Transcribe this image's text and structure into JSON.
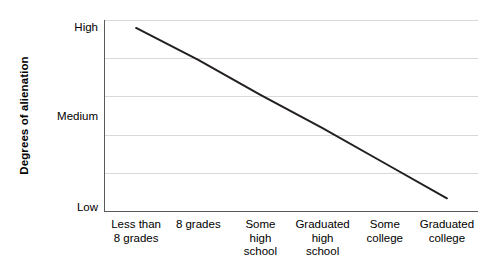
{
  "chart_data": {
    "type": "line",
    "title": "",
    "xlabel": "",
    "ylabel": "Degrees of alienation",
    "categories": [
      "Less than 8 grades",
      "8 grades",
      "Some high school",
      "Graduated high school",
      "Some college",
      "Graduated college"
    ],
    "category_lines": [
      [
        "Less than",
        "8 grades"
      ],
      [
        "8 grades"
      ],
      [
        "Some",
        "high",
        "school"
      ],
      [
        "Graduated",
        "high",
        "school"
      ],
      [
        "Some",
        "college"
      ],
      [
        "Graduated",
        "college"
      ]
    ],
    "ytick_labels": [
      "High",
      "Medium",
      "Low"
    ],
    "ylim": [
      0,
      6
    ],
    "ytick_values": [
      6,
      3,
      0
    ],
    "series": [
      {
        "name": "Degrees of alienation",
        "values": [
          5.75,
          4.75,
          3.65,
          2.6,
          1.5,
          0.4
        ],
        "color": "#231f20"
      }
    ],
    "grid": "horizontal",
    "gridline_count": 5,
    "gridline_color": "#d9d9d9",
    "axis_color": "#58595b",
    "legend": "none",
    "annotations": []
  },
  "axis": {
    "y_title": "Degrees of alienation",
    "y_ticks": {
      "high": "High",
      "medium": "Medium",
      "low": "Low"
    }
  }
}
